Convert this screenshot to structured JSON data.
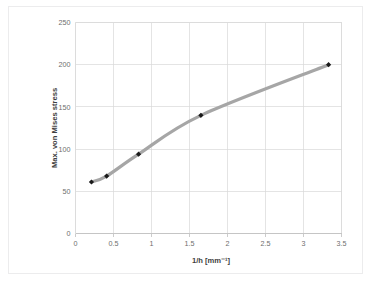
{
  "figure": {
    "background_color": "#ffffff",
    "frame_color": "#ececed"
  },
  "chart_data": {
    "type": "line",
    "title": "",
    "subtitle": "",
    "xlabel": "1/h [mm⁻¹]",
    "ylabel": "Max. von Mises stress",
    "xlim": [
      0,
      3.5
    ],
    "ylim": [
      0,
      250
    ],
    "xticks": [
      0,
      0.5,
      1,
      1.5,
      2,
      2.5,
      3,
      3.5
    ],
    "xtick_labels": [
      "0",
      "0.5",
      "1",
      "1.5",
      "2",
      "2.5",
      "3",
      "3.5"
    ],
    "yticks": [
      0,
      50,
      100,
      150,
      200,
      250
    ],
    "ytick_labels": [
      "0",
      "50",
      "100",
      "150",
      "200",
      "250"
    ],
    "grid": true,
    "grid_color": "#d9d9d9",
    "legend": false,
    "legend_position": "none",
    "line_color": "#a6a6a6",
    "line_width": 3.2,
    "marker_color": "#1a1a1a",
    "marker_size": 2.6,
    "marker_shape": "diamond",
    "x": [
      0.21,
      0.41,
      0.83,
      1.65,
      3.33
    ],
    "y": [
      61,
      68,
      94,
      140,
      200
    ],
    "series": [
      {
        "name": "Max. von Mises stress",
        "points": [
          {
            "x": 0.21,
            "y": 61
          },
          {
            "x": 0.41,
            "y": 68
          },
          {
            "x": 0.83,
            "y": 94
          },
          {
            "x": 1.65,
            "y": 140
          },
          {
            "x": 3.33,
            "y": 200
          }
        ]
      }
    ],
    "smooth": true,
    "annotations": []
  }
}
